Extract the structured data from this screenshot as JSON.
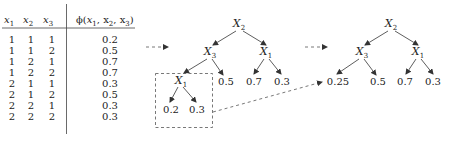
{
  "table": {
    "headers": [
      "x",
      "x",
      "x",
      "φ(x1, x2, x3)"
    ],
    "header_subs": [
      "1",
      "2",
      "3"
    ],
    "phi_label": "ϕ(",
    "phi_args": [
      "x",
      "1",
      ", x",
      "2",
      ", x",
      "3",
      ")"
    ],
    "rows": [
      {
        "x1": "1",
        "x2": "1",
        "x3": "1",
        "phi": "0.2"
      },
      {
        "x1": "1",
        "x2": "1",
        "x3": "2",
        "phi": "0.5"
      },
      {
        "x1": "1",
        "x2": "2",
        "x3": "1",
        "phi": "0.7"
      },
      {
        "x1": "1",
        "x2": "2",
        "x3": "2",
        "phi": "0.7"
      },
      {
        "x1": "2",
        "x2": "1",
        "x3": "1",
        "phi": "0.3"
      },
      {
        "x1": "2",
        "x2": "1",
        "x3": "2",
        "phi": "0.5"
      },
      {
        "x1": "2",
        "x2": "2",
        "x3": "1",
        "phi": "0.3"
      },
      {
        "x1": "2",
        "x2": "2",
        "x3": "2",
        "phi": "0.3"
      }
    ]
  },
  "tree1": {
    "root": {
      "var": "X",
      "sub": "2"
    },
    "left": {
      "var": "X",
      "sub": "3"
    },
    "right": {
      "var": "X",
      "sub": "1"
    },
    "left_left": {
      "var": "X",
      "sub": "1"
    },
    "leaves": {
      "ll_left": "0.2",
      "ll_right": "0.3",
      "left_right": "0.5",
      "right_left": "0.7",
      "right_right": "0.3"
    }
  },
  "tree2": {
    "root": {
      "var": "X",
      "sub": "2"
    },
    "left": {
      "var": "X",
      "sub": "3"
    },
    "right": {
      "var": "X",
      "sub": "1"
    },
    "leaves": {
      "left_left": "0.25",
      "left_right": "0.5",
      "right_left": "0.7",
      "right_right": "0.3"
    }
  },
  "colors": {
    "line": "#333333",
    "dash": "#555555",
    "text": "#222222"
  }
}
